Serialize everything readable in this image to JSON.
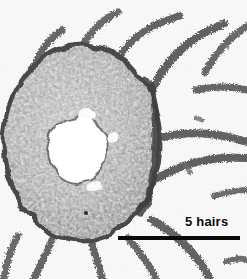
{
  "figure": {
    "width": 247,
    "height": 279,
    "modality": "light-micrograph",
    "color_mode": "grayscale"
  },
  "scale_bar": {
    "label": "5 hairs",
    "bar_color": "#0a0a0a",
    "bar_left_px": 118,
    "bar_right_px": 240,
    "bar_y_px": 238,
    "bar_length_px": 122,
    "label_x_px": 185,
    "label_y_px": 214
  },
  "specimen": {
    "name": "stem-cross-section",
    "center_x_px": 82,
    "center_y_px": 143,
    "radius_x_px": 78,
    "radius_y_px": 98,
    "lumen": {
      "name": "central-lumen",
      "center_x_px": 78,
      "center_y_px": 150,
      "radius_x_px": 30,
      "radius_y_px": 33,
      "fill": "#ffffff"
    },
    "cortex_fill": "#9a9a9a",
    "rim_color": "#4a4a4a"
  },
  "hairs": {
    "count": 16,
    "color": "#6e6e6e",
    "description": "curved radiating hair filaments with fuzzy spiny margins"
  },
  "palette": {
    "background": "#fbfbfb",
    "tissue_light": "#c9c9c9",
    "tissue_mid": "#9c9c9c",
    "tissue_dark": "#5a5a5a",
    "ink": "#0a0a0a"
  }
}
